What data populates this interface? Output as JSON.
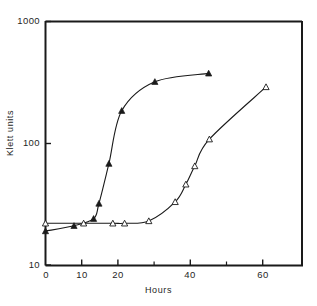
{
  "chart_data": {
    "type": "line",
    "title": "",
    "subtitle": "",
    "xlabel": "Hours",
    "ylabel": "Klett units",
    "xlim": [
      0,
      72
    ],
    "ylim": [
      10,
      1000
    ],
    "yscale": "log",
    "xscale": "linear",
    "grid": false,
    "legend": null,
    "xticks": [
      0,
      10,
      20,
      30,
      40,
      50,
      60
    ],
    "xtick_labels": [
      "0",
      "10",
      "20",
      "",
      "40",
      "",
      "60"
    ],
    "yticks": [
      10,
      100,
      1000
    ],
    "ytick_labels": [
      "10",
      "100",
      "1000"
    ],
    "series": [
      {
        "name": "filled-triangle-series",
        "marker": "filled-triangle",
        "color": "#1a1a1a",
        "points": [
          {
            "x": 0.0,
            "y": 19
          },
          {
            "x": 8.0,
            "y": 21
          },
          {
            "x": 13.5,
            "y": 24
          },
          {
            "x": 15.0,
            "y": 32
          },
          {
            "x": 17.8,
            "y": 68
          },
          {
            "x": 21.4,
            "y": 185
          },
          {
            "x": 30.7,
            "y": 320
          },
          {
            "x": 45.8,
            "y": 375
          }
        ]
      },
      {
        "name": "open-triangle-series",
        "marker": "open-triangle",
        "color": "#1a1a1a",
        "points": [
          {
            "x": 0.0,
            "y": 22
          },
          {
            "x": 10.7,
            "y": 22
          },
          {
            "x": 18.9,
            "y": 22
          },
          {
            "x": 22.2,
            "y": 22
          },
          {
            "x": 29.0,
            "y": 23
          },
          {
            "x": 36.4,
            "y": 33
          },
          {
            "x": 39.4,
            "y": 46
          },
          {
            "x": 41.9,
            "y": 65
          },
          {
            "x": 46.0,
            "y": 108
          },
          {
            "x": 61.9,
            "y": 290
          }
        ]
      }
    ]
  },
  "axes": {
    "ytick_1000": "1000",
    "ytick_100": "100",
    "ytick_10": "10",
    "xtick_0": "0",
    "xtick_10": "10",
    "xtick_20": "20",
    "xtick_40": "40",
    "xtick_60": "60",
    "y_axis_title": "Klett units",
    "x_axis_title": "Hours"
  }
}
